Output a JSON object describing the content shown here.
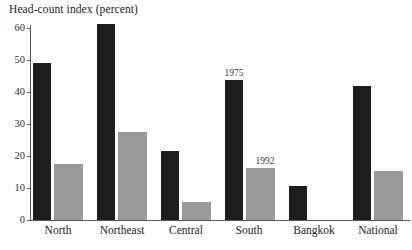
{
  "chart_data": {
    "type": "bar",
    "title": "Head-count index (percent)",
    "xlabel": "",
    "ylabel": "Head-count index (percent)",
    "ylim": [
      0,
      60
    ],
    "yticks": [
      0,
      10,
      20,
      30,
      40,
      50,
      60
    ],
    "grid": false,
    "legend_position": "inline-annotation",
    "categories": [
      "North",
      "Northeast",
      "Central",
      "South",
      "Bangkok",
      "National"
    ],
    "series": [
      {
        "name": "1975",
        "color": "#1e1e1e",
        "values": [
          48,
          60,
          21,
          43,
          10.5,
          41
        ]
      },
      {
        "name": "1992",
        "color": "#999999",
        "values": [
          17,
          27,
          5.5,
          16,
          null,
          15
        ]
      }
    ],
    "annotations": [
      {
        "text": "1975",
        "category": "South",
        "series": "1975"
      },
      {
        "text": "1992",
        "category": "South",
        "series": "1992"
      }
    ]
  },
  "axis": {
    "y_tick_labels": [
      "60",
      "50",
      "40",
      "30",
      "20",
      "10",
      "0"
    ],
    "x_tick_labels": [
      "North",
      "Northeast",
      "Central",
      "South",
      "Bangkok",
      "National"
    ]
  },
  "colors": {
    "series_1975": "#1e1e1e",
    "series_1992": "#999999",
    "axis": "#565656",
    "text": "#232323",
    "background": "#ffffff"
  }
}
